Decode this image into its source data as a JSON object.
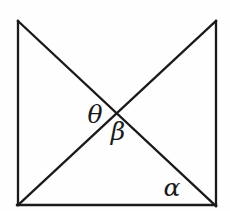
{
  "figure": {
    "type": "geometry-diagram",
    "background_color": "#fefefe",
    "line_color": "#1a1a1a",
    "line_width": 2.3,
    "width": 230,
    "height": 211,
    "lines": [
      {
        "name": "left-side-line",
        "x1": 18,
        "y1": 21,
        "x2": 18,
        "y2": 205
      },
      {
        "name": "right-side-line",
        "x1": 216,
        "y1": 21,
        "x2": 216,
        "y2": 206
      },
      {
        "name": "bottom-side-line",
        "x1": 17,
        "y1": 205,
        "x2": 216,
        "y2": 205
      },
      {
        "name": "diagonal-topleft-bottomright-line",
        "x1": 18,
        "y1": 21,
        "x2": 216,
        "y2": 206
      },
      {
        "name": "diagonal-topright-bottomleft-line",
        "x1": 216,
        "y1": 21,
        "x2": 18,
        "y2": 205
      }
    ],
    "labels": [
      {
        "name": "angle-theta-label",
        "text": "θ",
        "x": 95,
        "y": 123,
        "font_size": 25
      },
      {
        "name": "angle-beta-label",
        "text": "β",
        "x": 118,
        "y": 140,
        "font_size": 25
      },
      {
        "name": "angle-alpha-label",
        "text": "α",
        "x": 172,
        "y": 196,
        "font_size": 25
      }
    ]
  }
}
